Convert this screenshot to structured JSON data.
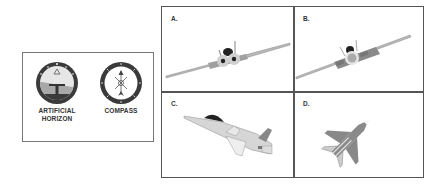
{
  "instruments": {
    "items": [
      {
        "label_line1": "ARTIFICIAL",
        "label_line2": "HORIZON",
        "icon": "artificial-horizon-icon"
      },
      {
        "label_line1": "COMPASS",
        "label_line2": "",
        "icon": "compass-icon"
      }
    ]
  },
  "options": [
    {
      "label": "A.",
      "description": "jet viewed from behind, banked slightly left"
    },
    {
      "label": "B.",
      "description": "jet viewed from behind, banked right"
    },
    {
      "label": "C.",
      "description": "jet side view, nose pitched up-left"
    },
    {
      "label": "D.",
      "description": "jet top view, heading north-east"
    }
  ],
  "colors": {
    "border": "#555555",
    "aircraft": "#b8b8b8",
    "aircraft_dark": "#7a7a7a",
    "canopy": "#222222"
  }
}
